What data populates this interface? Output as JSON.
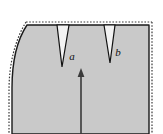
{
  "figure": {
    "kind": "technical-diagram",
    "canvas": {
      "width": 163,
      "height": 134
    },
    "background_color": "#ffffff"
  },
  "specimen": {
    "name": "specimen-body",
    "fill_color": "#c9c9c9",
    "outline_color": "#1a1a1a",
    "outline_width": 1.4,
    "deformed_outline_path": "M 27 25 L 149 25 L 149 134 L 12 134 L 12 88 C 12 62 17 40 27 25 Z",
    "description": "Deformed gray body with straight right edge, straight top edge and a left edge that bows outward toward the lower left."
  },
  "undeformed_outline": {
    "name": "original-shape-outline",
    "color": "#3a3a3a",
    "dash_pattern": "1.6 1.6",
    "width": 1.2,
    "top_path": "M 26 22 L 152 22",
    "right_path": "M 152 22 L 152 134",
    "left_path": "M 26 22 C 15 40 9 64 9 90 L 9 134",
    "description": "Dotted line showing the original undeformed boundary offset slightly outside the solid deformed boundary."
  },
  "notches": [
    {
      "id": "notch-a",
      "label": "a",
      "label_x": 72,
      "label_y": 60,
      "mouth_left_x": 57,
      "mouth_right_x": 69,
      "mouth_y": 25,
      "tip_x": 62,
      "tip_y": 67,
      "depth_px": 42,
      "mouth_width_px": 12,
      "shape": "sharp V-shaped surface notch",
      "fill_color": "#f2f2f2",
      "outline_color": "#111111"
    },
    {
      "id": "notch-b",
      "label": "b",
      "label_x": 118,
      "label_y": 56,
      "mouth_left_x": 104,
      "mouth_right_x": 115,
      "mouth_y": 25,
      "tip_x": 110,
      "tip_y": 63,
      "depth_px": 38,
      "mouth_width_px": 11,
      "shape": "sharp V-shaped surface notch",
      "fill_color": "#f2f2f2",
      "outline_color": "#111111"
    }
  ],
  "load_arrow": {
    "name": "tensile-load-arrow",
    "direction": "up",
    "color": "#3a3a3a",
    "shaft_x": 81,
    "shaft_top_y": 74,
    "shaft_bottom_y": 134,
    "shaft_width": 1.6,
    "head_half_width": 3.4,
    "head_height": 9,
    "head_tip_y": 68
  },
  "labels": {
    "notch_a": "a",
    "notch_b": "b"
  }
}
